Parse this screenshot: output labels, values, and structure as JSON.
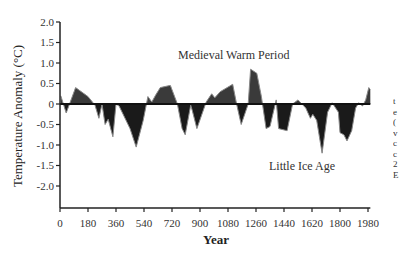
{
  "chart_data": {
    "type": "area",
    "title": "",
    "xlabel": "Year",
    "ylabel": "Temperature Anomaly (°C)",
    "xlim": [
      0,
      2000
    ],
    "ylim": [
      -2.5,
      2.0
    ],
    "grid": false,
    "legend": null,
    "x_ticks": [
      0,
      180,
      360,
      540,
      720,
      900,
      1080,
      1260,
      1440,
      1620,
      1800,
      1980
    ],
    "y_ticks": [
      2.0,
      1.5,
      1.0,
      0.5,
      0,
      -0.5,
      -1.0,
      -1.5,
      -2.0
    ],
    "y_tick_labels": [
      "2.0",
      "1.5",
      "1.0",
      "0.5",
      "0",
      "-0.5",
      "-1.0",
      "-1.5",
      "-2.0"
    ],
    "annotations": [
      {
        "text": "Medieval Warm Period",
        "x": 1050,
        "y": 1.15
      },
      {
        "text": "Little Ice Age",
        "x": 1650,
        "y": -1.3
      }
    ],
    "series": [
      {
        "name": "Temperature Anomaly",
        "fill_positive": "#3a3a3a",
        "fill_negative": "#1a1a1a",
        "line_color": "#888888",
        "x": [
          5,
          40,
          100,
          180,
          225,
          250,
          270,
          290,
          310,
          340,
          360,
          380,
          450,
          490,
          535,
          565,
          590,
          615,
          645,
          705,
          710,
          755,
          785,
          805,
          840,
          850,
          880,
          940,
          975,
          995,
          1030,
          1110,
          1135,
          1165,
          1210,
          1225,
          1265,
          1295,
          1325,
          1350,
          1390,
          1405,
          1460,
          1495,
          1530,
          1580,
          1610,
          1625,
          1650,
          1685,
          1720,
          1750,
          1790,
          1800,
          1825,
          1845,
          1875,
          1900,
          1920,
          1945,
          1965,
          1985,
          1995
        ],
        "y": [
          0.2,
          -0.22,
          0.4,
          0.18,
          -0.03,
          -0.35,
          0.0,
          -0.5,
          -0.37,
          -0.8,
          0.0,
          -0.05,
          -0.6,
          -1.05,
          -0.4,
          0.18,
          0.05,
          0.22,
          0.4,
          0.45,
          0.45,
          0.0,
          -0.6,
          -0.75,
          -0.03,
          -0.15,
          -0.6,
          0.05,
          0.25,
          0.15,
          0.3,
          0.48,
          0.0,
          -0.5,
          0.0,
          0.85,
          0.75,
          0.18,
          -0.6,
          -0.55,
          0.1,
          -0.6,
          -0.65,
          0.0,
          0.1,
          -0.1,
          -0.35,
          -0.25,
          -0.4,
          -1.2,
          -0.2,
          0.03,
          -0.2,
          -0.7,
          -0.75,
          -0.9,
          -0.65,
          -0.1,
          0.03,
          -0.05,
          0.1,
          0.4,
          0.35
        ]
      }
    ]
  },
  "edge_text": "t\ne\n(\nv\nc\nc\n2\nE"
}
